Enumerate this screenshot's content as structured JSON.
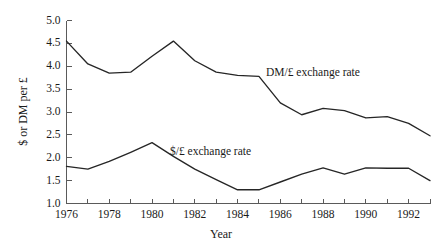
{
  "chart_data": {
    "type": "line",
    "title": "",
    "subtitle": "",
    "xlabel": "Year",
    "ylabel": "$ or DM per £",
    "xlim": [
      1976,
      1993
    ],
    "ylim": [
      1.0,
      5.0
    ],
    "grid": false,
    "legend_position": "inline-annotation",
    "x": [
      1976,
      1977,
      1978,
      1979,
      1980,
      1981,
      1982,
      1983,
      1984,
      1985,
      1986,
      1987,
      1988,
      1989,
      1990,
      1991,
      1992,
      1993
    ],
    "xtick_labels": [
      "1976",
      "1978",
      "1980",
      "1982",
      "1984",
      "1986",
      "1988",
      "1990",
      "1992"
    ],
    "xtick_values": [
      1976,
      1978,
      1980,
      1982,
      1984,
      1986,
      1988,
      1990,
      1992
    ],
    "xminor_values": [
      1977,
      1979,
      1981,
      1983,
      1985,
      1987,
      1989,
      1991,
      1993
    ],
    "ytick_labels": [
      "1.0",
      "1.5",
      "2.0",
      "2.5",
      "3.0",
      "3.5",
      "4.0",
      "4.5",
      "5.0"
    ],
    "ytick_values": [
      1.0,
      1.5,
      2.0,
      2.5,
      3.0,
      3.5,
      4.0,
      4.5,
      5.0
    ],
    "series": [
      {
        "name": "DM/£ exchange rate",
        "annotation": "DM/£ exchange rate",
        "color": "#262626",
        "values": [
          4.55,
          4.05,
          3.85,
          3.87,
          4.22,
          4.55,
          4.12,
          3.87,
          3.8,
          3.78,
          3.2,
          2.94,
          3.08,
          3.03,
          2.87,
          2.9,
          2.75,
          2.48
        ]
      },
      {
        "name": "$/£ exchange rate",
        "annotation": "$/£ exchange rate",
        "color": "#262626",
        "values": [
          1.81,
          1.75,
          1.92,
          2.12,
          2.33,
          2.03,
          1.75,
          1.52,
          1.3,
          1.3,
          1.47,
          1.64,
          1.78,
          1.64,
          1.78,
          1.77,
          1.77,
          1.5
        ]
      }
    ]
  }
}
